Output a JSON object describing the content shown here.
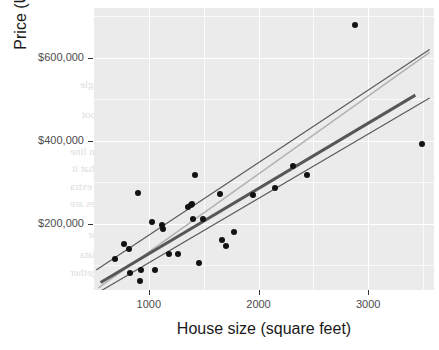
{
  "chart_data": {
    "type": "scatter",
    "title": "",
    "xlabel": "House size (square feet)",
    "ylabel": "Price (USD)",
    "xlim": [
      500,
      3600
    ],
    "ylim": [
      40000,
      720000
    ],
    "xticks": [
      1000,
      2000,
      3000
    ],
    "xtick_labels": [
      "1000",
      "2000",
      "3000"
    ],
    "yticks": [
      200000,
      400000,
      600000
    ],
    "ytick_labels": [
      "$200,000",
      "$400,000",
      "$600,000"
    ],
    "grid": true,
    "legend": "none",
    "panel_background": "#ebebeb",
    "point_color": "#121212",
    "points": [
      {
        "x": 690,
        "y": 115000
      },
      {
        "x": 770,
        "y": 150000
      },
      {
        "x": 820,
        "y": 140000
      },
      {
        "x": 830,
        "y": 82000
      },
      {
        "x": 900,
        "y": 275000
      },
      {
        "x": 920,
        "y": 62000
      },
      {
        "x": 930,
        "y": 88000
      },
      {
        "x": 1030,
        "y": 205000
      },
      {
        "x": 1060,
        "y": 88000
      },
      {
        "x": 1120,
        "y": 196000
      },
      {
        "x": 1130,
        "y": 188000
      },
      {
        "x": 1180,
        "y": 128000
      },
      {
        "x": 1270,
        "y": 128000
      },
      {
        "x": 1360,
        "y": 240000
      },
      {
        "x": 1380,
        "y": 245000
      },
      {
        "x": 1390,
        "y": 248000
      },
      {
        "x": 1400,
        "y": 212000
      },
      {
        "x": 1420,
        "y": 318000
      },
      {
        "x": 1460,
        "y": 105000
      },
      {
        "x": 1490,
        "y": 212000
      },
      {
        "x": 1650,
        "y": 272000
      },
      {
        "x": 1670,
        "y": 160000
      },
      {
        "x": 1700,
        "y": 145000
      },
      {
        "x": 1780,
        "y": 180000
      },
      {
        "x": 1950,
        "y": 270000
      },
      {
        "x": 2150,
        "y": 285000
      },
      {
        "x": 2310,
        "y": 340000
      },
      {
        "x": 2440,
        "y": 318000
      },
      {
        "x": 2880,
        "y": 680000
      },
      {
        "x": 3490,
        "y": 393000
      }
    ],
    "lines": [
      {
        "name": "upper-fit-line",
        "color": "#5a5a5a",
        "width": 1.2,
        "x0": 520,
        "y0": 88000,
        "x1": 3560,
        "y1": 620000
      },
      {
        "name": "light-gray-fit-line",
        "color": "#b3b3b3",
        "width": 1.6,
        "x0": 540,
        "y0": 45000,
        "x1": 3560,
        "y1": 613000
      },
      {
        "name": "main-regression-line",
        "color": "#575757",
        "width": 3.0,
        "x0": 560,
        "y0": 58000,
        "x1": 3430,
        "y1": 510000
      },
      {
        "name": "lower-fit-line",
        "color": "#5a5a5a",
        "width": 1.2,
        "x0": 545,
        "y0": 35000,
        "x1": 3560,
        "y1": 503000
      }
    ]
  },
  "ghost_text": [
    {
      "text": "ear regression in R",
      "left": 196,
      "top": 45,
      "size": 15
    },
    {
      "text": "an do linear regression in R using a single",
      "left": 80,
      "top": 78,
      "size": 11
    },
    {
      "text": "tively small, the price per square foot",
      "left": 82,
      "top": 108,
      "size": 11
    },
    {
      "text": "ngle number. A unique feature",
      "left": 104,
      "top": 125,
      "size": 11
    },
    {
      "text": "n of scatter plot fitting regression line",
      "left": 70,
      "top": 145,
      "size": 11
    },
    {
      "text": "with those included to illustrate that it",
      "left": 72,
      "top": 162,
      "size": 11
    },
    {
      "text": "ou should be familiar to provide extra",
      "left": 70,
      "top": 180,
      "size": 11
    },
    {
      "text": "regression method plot the values are",
      "left": 70,
      "top": 197,
      "size": 11
    },
    {
      "text": "tice, we fit the leading predictor",
      "left": 88,
      "top": 228,
      "size": 11
    },
    {
      "text": "some extra processing of the data",
      "left": 80,
      "top": 248,
      "size": 11
    },
    {
      "text": "original plot. The constructed together",
      "left": 70,
      "top": 266,
      "size": 11
    }
  ]
}
